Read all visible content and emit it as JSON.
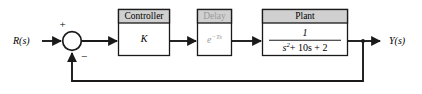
{
  "diagram": {
    "background_color": "#ffffff",
    "line_color": "#1a1a1a",
    "block_header_fill": "#d0d0d0",
    "block_body_fill": "#ffffff",
    "block_border_color": "#1a1a1a",
    "faded_text_color": "#9a9a9a"
  },
  "signals": {
    "input_label": "R(s)",
    "output_label": "Y(s)"
  },
  "summing_junction": {
    "name": "summing-junction",
    "positive_sign": "+",
    "negative_sign": "−"
  },
  "blocks": [
    {
      "id": "controller",
      "title": "Controller",
      "body": "K",
      "body_kind": "plain",
      "faded": false
    },
    {
      "id": "delay",
      "title": "Delay",
      "body": "e−Ts",
      "body_base": "e",
      "body_exponent": "−Ts",
      "body_kind": "exponential",
      "faded": true
    },
    {
      "id": "plant",
      "title": "Plant",
      "body_kind": "fraction",
      "numerator": "1",
      "denominator_base": "s",
      "denominator_exponent": "2",
      "denominator_rest": "+ 10s + 2",
      "denominator": "s2 + 10s + 2",
      "faded": false
    }
  ],
  "connections": {
    "feedback_path_label": "unity feedback",
    "forward_path_label": "forward path"
  }
}
